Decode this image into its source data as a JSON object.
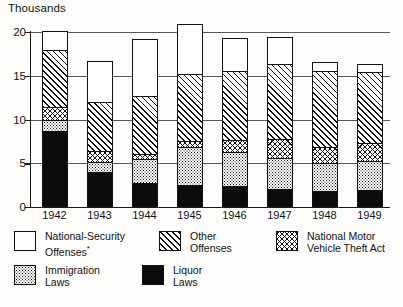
{
  "chart_data": {
    "type": "bar",
    "subtype": "stacked-bar",
    "title": "",
    "unit_label": "Thousands",
    "xlabel": "",
    "ylabel": "Thousands",
    "ylim": [
      0,
      20
    ],
    "yticks": [
      0,
      5,
      10,
      15,
      20
    ],
    "grid": true,
    "legend_position": "bottom",
    "categories": [
      "1942",
      "1943",
      "1944",
      "1945",
      "1946",
      "1947",
      "1948",
      "1949"
    ],
    "series": [
      {
        "name": "Liquor Laws",
        "pattern": "solid-black",
        "values": [
          8.7,
          4.0,
          2.8,
          2.5,
          2.4,
          2.1,
          1.8,
          2.0
        ]
      },
      {
        "name": "Immigration Laws",
        "pattern": "stipple",
        "values": [
          1.2,
          1.2,
          2.7,
          4.4,
          3.9,
          3.5,
          3.2,
          3.3
        ]
      },
      {
        "name": "National Motor Vehicle Theft Act",
        "pattern": "crosshatch",
        "values": [
          1.5,
          1.2,
          0.6,
          0.7,
          1.4,
          2.2,
          1.9,
          2.0
        ]
      },
      {
        "name": "Other Offenses",
        "pattern": "diagonal",
        "values": [
          6.6,
          5.6,
          6.6,
          7.6,
          7.8,
          8.5,
          8.6,
          8.1
        ]
      },
      {
        "name": "National-Security Offenses*",
        "pattern": "white",
        "values": [
          2.1,
          4.7,
          6.5,
          5.7,
          3.8,
          3.1,
          1.1,
          1.0
        ]
      }
    ],
    "totals": [
      20.1,
      16.7,
      19.2,
      20.9,
      19.3,
      19.4,
      16.6,
      16.4
    ],
    "cumulative_boundaries": {
      "1942": [
        8.7,
        9.9,
        11.4,
        18.0,
        20.1
      ],
      "1943": [
        4.0,
        5.2,
        6.4,
        12.0,
        16.7
      ],
      "1944": [
        2.8,
        5.5,
        6.1,
        12.7,
        19.2
      ],
      "1945": [
        2.5,
        6.9,
        7.6,
        15.2,
        20.9
      ],
      "1946": [
        2.4,
        6.3,
        7.7,
        15.5,
        19.3
      ],
      "1947": [
        2.1,
        5.6,
        7.8,
        16.3,
        19.4
      ],
      "1948": [
        1.8,
        5.0,
        6.9,
        15.5,
        16.6
      ],
      "1949": [
        2.0,
        5.3,
        7.3,
        15.4,
        16.4
      ]
    }
  },
  "axis": {
    "unit_title": "Thousands",
    "yticks": [
      "0",
      "5",
      "10",
      "15",
      "20"
    ],
    "xticks": [
      "1942",
      "1943",
      "1944",
      "1945",
      "1946",
      "1947",
      "1948",
      "1949"
    ]
  },
  "legend": {
    "items": [
      {
        "label": "National-Security\nOffenses",
        "superscript": "*",
        "pattern": "white"
      },
      {
        "label": "Other\nOffenses",
        "superscript": "",
        "pattern": "diagonal"
      },
      {
        "label": "National Motor\nVehicle Theft Act",
        "superscript": "",
        "pattern": "crosshatch"
      },
      {
        "label": "Immigration\nLaws",
        "superscript": "",
        "pattern": "stipple"
      },
      {
        "label": "Liquor\nLaws",
        "superscript": "",
        "pattern": "solid-black"
      }
    ]
  },
  "colors": {
    "ink": "#111111",
    "paper": "#fdfdfb",
    "fill_black": "#0b0b0b",
    "fill_white": "#ffffff"
  }
}
